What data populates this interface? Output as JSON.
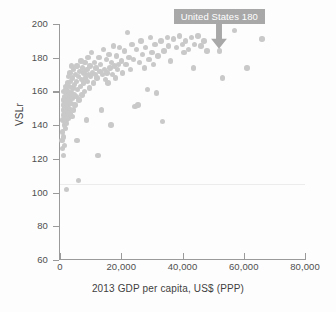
{
  "chart_data": {
    "type": "scatter",
    "title": "",
    "xlabel": "2013 GDP per capita, US$ (PPP)",
    "ylabel": "VSLr",
    "xlim": [
      0,
      80000
    ],
    "ylim": [
      60,
      200
    ],
    "xticks": [
      0,
      20000,
      40000,
      60000,
      80000
    ],
    "xticklabels": [
      "0",
      "20,000",
      "40,000",
      "60,000",
      "80,000"
    ],
    "yticks": [
      60,
      80,
      100,
      120,
      140,
      160,
      180,
      200
    ],
    "yticklabels": [
      "60",
      "80",
      "100",
      "120",
      "140",
      "160",
      "180",
      "200"
    ],
    "grid": false,
    "faint_gridline_y": 105,
    "legend": null,
    "marker_color": "#c9c9c9",
    "annotations": [
      {
        "label": "United States 180",
        "x": 52000,
        "y": 180,
        "box_color": "#a8a8a8",
        "text_color": "#ffffff",
        "arrow": "down"
      }
    ],
    "points": [
      [
        700,
        131
      ],
      [
        800,
        126
      ],
      [
        900,
        136
      ],
      [
        1000,
        143
      ],
      [
        1050,
        122
      ],
      [
        1100,
        149
      ],
      [
        1150,
        155
      ],
      [
        1200,
        133
      ],
      [
        1250,
        146
      ],
      [
        1300,
        152
      ],
      [
        1350,
        160
      ],
      [
        1400,
        140
      ],
      [
        1450,
        128
      ],
      [
        1500,
        151
      ],
      [
        1550,
        147
      ],
      [
        1600,
        157
      ],
      [
        1650,
        144
      ],
      [
        1700,
        138
      ],
      [
        1750,
        163
      ],
      [
        1800,
        150
      ],
      [
        1850,
        155
      ],
      [
        1900,
        143
      ],
      [
        1950,
        148
      ],
      [
        2000,
        161
      ],
      [
        2100,
        153
      ],
      [
        2150,
        102
      ],
      [
        2200,
        141
      ],
      [
        2250,
        158
      ],
      [
        2300,
        146
      ],
      [
        2400,
        165
      ],
      [
        2450,
        152
      ],
      [
        2500,
        157
      ],
      [
        2600,
        148
      ],
      [
        2700,
        169
      ],
      [
        2750,
        144
      ],
      [
        2800,
        160
      ],
      [
        2900,
        155
      ],
      [
        3000,
        163
      ],
      [
        3100,
        150
      ],
      [
        3200,
        158
      ],
      [
        3300,
        171
      ],
      [
        3400,
        147
      ],
      [
        3500,
        166
      ],
      [
        3600,
        153
      ],
      [
        3700,
        175
      ],
      [
        3800,
        159
      ],
      [
        3900,
        145
      ],
      [
        4000,
        168
      ],
      [
        4100,
        156
      ],
      [
        4200,
        162
      ],
      [
        4400,
        149
      ],
      [
        4500,
        173
      ],
      [
        4600,
        158
      ],
      [
        4800,
        164
      ],
      [
        4900,
        152
      ],
      [
        5000,
        170
      ],
      [
        5200,
        157
      ],
      [
        5400,
        166
      ],
      [
        5500,
        131
      ],
      [
        5600,
        175
      ],
      [
        5800,
        161
      ],
      [
        6000,
        169
      ],
      [
        6100,
        107
      ],
      [
        6200,
        155
      ],
      [
        6400,
        172
      ],
      [
        6600,
        163
      ],
      [
        6800,
        178
      ],
      [
        7000,
        167
      ],
      [
        7200,
        158
      ],
      [
        7400,
        174
      ],
      [
        7600,
        165
      ],
      [
        7800,
        171
      ],
      [
        8000,
        160
      ],
      [
        8200,
        177
      ],
      [
        8400,
        168
      ],
      [
        8600,
        143
      ],
      [
        8800,
        173
      ],
      [
        9000,
        166
      ],
      [
        9200,
        180
      ],
      [
        9400,
        170
      ],
      [
        9600,
        162
      ],
      [
        9800,
        175
      ],
      [
        10000,
        169
      ],
      [
        10300,
        183
      ],
      [
        10600,
        171
      ],
      [
        10900,
        165
      ],
      [
        11200,
        177
      ],
      [
        11500,
        170
      ],
      [
        11800,
        174
      ],
      [
        12100,
        168
      ],
      [
        12400,
        122
      ],
      [
        12700,
        180
      ],
      [
        13000,
        172
      ],
      [
        13300,
        176
      ],
      [
        13600,
        149
      ],
      [
        13900,
        170
      ],
      [
        14200,
        185
      ],
      [
        14500,
        173
      ],
      [
        14800,
        167
      ],
      [
        15100,
        179
      ],
      [
        15400,
        171
      ],
      [
        15700,
        165
      ],
      [
        16000,
        182
      ],
      [
        16300,
        174
      ],
      [
        16600,
        140
      ],
      [
        16900,
        177
      ],
      [
        17200,
        170
      ],
      [
        17500,
        187
      ],
      [
        17800,
        175
      ],
      [
        18100,
        168
      ],
      [
        18400,
        181
      ],
      [
        18700,
        173
      ],
      [
        19000,
        176
      ],
      [
        19500,
        186
      ],
      [
        20000,
        178
      ],
      [
        20500,
        171
      ],
      [
        21000,
        184
      ],
      [
        21500,
        176
      ],
      [
        22000,
        195
      ],
      [
        22500,
        180
      ],
      [
        23000,
        173
      ],
      [
        23500,
        188
      ],
      [
        24000,
        179
      ],
      [
        24500,
        151
      ],
      [
        25000,
        185
      ],
      [
        25500,
        152
      ],
      [
        26000,
        177
      ],
      [
        26500,
        190
      ],
      [
        27000,
        182
      ],
      [
        27500,
        174
      ],
      [
        28000,
        186
      ],
      [
        28500,
        161
      ],
      [
        29000,
        179
      ],
      [
        29500,
        192
      ],
      [
        30000,
        183
      ],
      [
        30500,
        176
      ],
      [
        31000,
        188
      ],
      [
        31500,
        159
      ],
      [
        32000,
        181
      ],
      [
        33000,
        190
      ],
      [
        33500,
        142
      ],
      [
        34000,
        184
      ],
      [
        35000,
        192
      ],
      [
        35500,
        187
      ],
      [
        36000,
        178
      ],
      [
        37000,
        191
      ],
      [
        38000,
        186
      ],
      [
        39000,
        193
      ],
      [
        40000,
        188
      ],
      [
        40500,
        183
      ],
      [
        41000,
        190
      ],
      [
        42000,
        185
      ],
      [
        43000,
        192
      ],
      [
        43500,
        174
      ],
      [
        44000,
        188
      ],
      [
        45000,
        193
      ],
      [
        46000,
        187
      ],
      [
        47000,
        190
      ],
      [
        48000,
        184
      ],
      [
        52000,
        184
      ],
      [
        53000,
        168
      ],
      [
        57000,
        196
      ],
      [
        61000,
        174
      ],
      [
        66000,
        191
      ]
    ]
  }
}
